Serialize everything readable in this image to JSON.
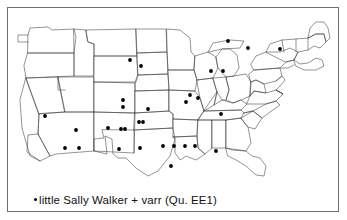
{
  "figure": {
    "type": "dot-distribution-map",
    "region": "continental-united-states",
    "border_color": "#6e6e6e",
    "background_color": "#ffffff",
    "outline_color": "#333333",
    "dot_color": "#000000"
  },
  "caption": {
    "legend_marker": "dot",
    "text": "little Sally Walker + varr  (Qu. EE1)",
    "headword": "little Sally Walker",
    "variants_label": "+ varr",
    "question_number": "Qu. EE1"
  },
  "map_data": {
    "type": "scatter",
    "title": "little Sally Walker + varr  (Qu. EE1)",
    "marker": "filled-circle",
    "marker_size_px": 2.6,
    "point_count": 41,
    "viewbox": [
      0,
      0,
      330,
      204
    ],
    "points": [
      {
        "x": 37,
        "y": 108
      },
      {
        "x": 122,
        "y": 52
      },
      {
        "x": 133,
        "y": 58
      },
      {
        "x": 115,
        "y": 92
      },
      {
        "x": 115,
        "y": 99
      },
      {
        "x": 140,
        "y": 101
      },
      {
        "x": 182,
        "y": 87
      },
      {
        "x": 178,
        "y": 94
      },
      {
        "x": 190,
        "y": 90
      },
      {
        "x": 203,
        "y": 63
      },
      {
        "x": 215,
        "y": 63
      },
      {
        "x": 213,
        "y": 106
      },
      {
        "x": 220,
        "y": 33
      },
      {
        "x": 240,
        "y": 40
      },
      {
        "x": 272,
        "y": 41
      },
      {
        "x": 68,
        "y": 122
      },
      {
        "x": 57,
        "y": 140
      },
      {
        "x": 71,
        "y": 140
      },
      {
        "x": 100,
        "y": 120
      },
      {
        "x": 113,
        "y": 121
      },
      {
        "x": 117,
        "y": 121
      },
      {
        "x": 131,
        "y": 114
      },
      {
        "x": 135,
        "y": 114
      },
      {
        "x": 111,
        "y": 141
      },
      {
        "x": 132,
        "y": 140
      },
      {
        "x": 155,
        "y": 138
      },
      {
        "x": 166,
        "y": 138
      },
      {
        "x": 177,
        "y": 138
      },
      {
        "x": 187,
        "y": 138
      },
      {
        "x": 208,
        "y": 143
      },
      {
        "x": 163,
        "y": 158
      }
    ]
  },
  "outlines": {
    "description": "state boundary polylines of the continental United States"
  }
}
